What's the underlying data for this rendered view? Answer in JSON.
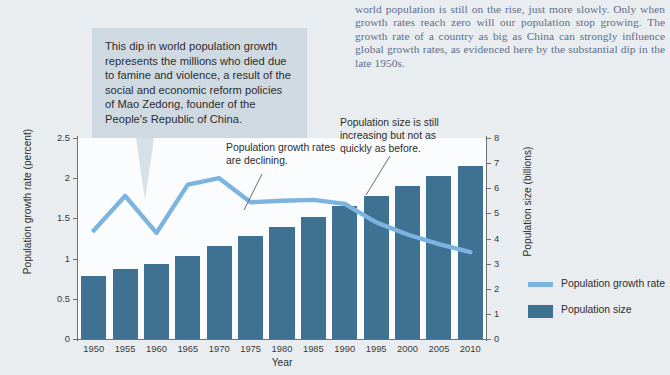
{
  "body_copy": "world population is still on the rise, just more slowly. Only when growth rates reach zero will our population stop growing. The growth rate of a country as big as China can strongly influence global growth rates, as evidenced here by the substantial dip in the late 1950s.",
  "callout": {
    "text": "This dip in world population growth represents the millions who died due to famine and violence, a result of the social and economic reform policies of Mao Zedong, founder of the People's Republic of China."
  },
  "annotations": [
    {
      "id": "growth-declining",
      "text": "Population growth rates are declining."
    },
    {
      "id": "size-increasing",
      "text": "Population size is still increasing but not as quickly as before."
    }
  ],
  "legend": [
    {
      "label": "Population growth rate",
      "color": "#7db3df",
      "marker": "line"
    },
    {
      "label": "Population size",
      "color": "#3f7193",
      "marker": "bar"
    }
  ],
  "colors": {
    "background": "#e9edef",
    "plot_background": "#fafcfd",
    "bar": "#3f7193",
    "line": "#7db3df",
    "callout_box": "#cfd9e2",
    "body_text": "#5d6e8c"
  },
  "chart_data": {
    "type": "bar",
    "title": "",
    "xlabel": "Year",
    "ylabel": "Population growth rate (percent)",
    "ylabel_right": "Population size (billions)",
    "categories": [
      "1950",
      "1955",
      "1960",
      "1965",
      "1970",
      "1975",
      "1980",
      "1985",
      "1990",
      "1995",
      "2000",
      "2005",
      "2010"
    ],
    "ylim": [
      0,
      2.5
    ],
    "yticks": [
      0,
      0.5,
      1,
      1.5,
      2,
      2.5
    ],
    "ytick_labels": [
      "0",
      "0.5",
      "1",
      "1.5",
      "2",
      "2.5"
    ],
    "ylim_right": [
      0,
      8
    ],
    "yticks_right": [
      0,
      1,
      2,
      3,
      4,
      5,
      6,
      7,
      8
    ],
    "ytick_labels_right": [
      "0",
      "1",
      "2",
      "3",
      "4",
      "5",
      "6",
      "7",
      "8"
    ],
    "grid": false,
    "legend_position": "right",
    "series": [
      {
        "name": "Population size",
        "type": "bar",
        "axis": "right",
        "unit": "billions",
        "color": "#3f7193",
        "values": [
          2.5,
          2.8,
          3.0,
          3.3,
          3.7,
          4.1,
          4.45,
          4.85,
          5.3,
          5.7,
          6.1,
          6.5,
          6.9
        ]
      },
      {
        "name": "Population growth rate",
        "type": "line",
        "axis": "left",
        "unit": "percent",
        "color": "#7db3df",
        "values": [
          1.35,
          1.78,
          1.32,
          1.92,
          2.0,
          1.7,
          1.72,
          1.73,
          1.68,
          1.45,
          1.3,
          1.18,
          1.08
        ]
      }
    ]
  }
}
